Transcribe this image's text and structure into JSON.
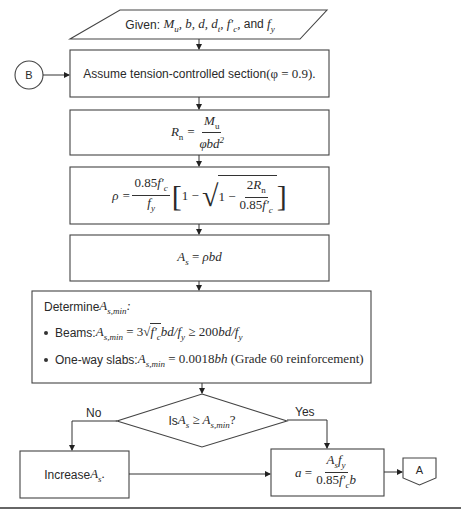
{
  "diagram": {
    "type": "flowchart",
    "nodes": {
      "given": {
        "shape": "parallelogram",
        "prefix": "Given: ",
        "vars": "Mu, b, d, dt, f'c, and fy"
      },
      "assume": {
        "shape": "process",
        "text": "Assume tension-controlled section ",
        "math": "(φ = 0.9)."
      },
      "rn": {
        "shape": "process",
        "lhs": "Rn =",
        "num": "Mu",
        "den": "φbd²"
      },
      "rho": {
        "shape": "process",
        "lhs": "ρ =",
        "num": "0.85f'c",
        "den": "fy",
        "bracket": "[1 − √(1 − 2Rn / 0.85f'c)]",
        "inner_num": "2Rn",
        "inner_den": "0.85f'c"
      },
      "as": {
        "shape": "process",
        "text": "As = ρbd"
      },
      "determine": {
        "shape": "process",
        "title": "Determine ",
        "title_math": "As,min:",
        "bullets": [
          {
            "label": "Beams: ",
            "math": "As,min = 3√f'c bd/fy ≥ 200bd/fy"
          },
          {
            "label": "One-way slabs: ",
            "math": "As,min = 0.0018bh (Grade 60 reinforcement)"
          }
        ]
      },
      "decision": {
        "shape": "diamond",
        "prefix": "Is ",
        "math": "As ≥ As,min?"
      },
      "increase": {
        "shape": "process",
        "text": "Increase ",
        "math": "As."
      },
      "a": {
        "shape": "process",
        "lhs": "a =",
        "num": "As fy",
        "den": "0.85f'c b"
      },
      "connector_b": {
        "shape": "on-page-connector",
        "label": "B"
      },
      "connector_a": {
        "shape": "off-page-connector",
        "label": "A"
      }
    },
    "edges": [
      {
        "from": "given",
        "to": "assume"
      },
      {
        "from": "connector_b",
        "to": "assume"
      },
      {
        "from": "assume",
        "to": "rn"
      },
      {
        "from": "rn",
        "to": "rho"
      },
      {
        "from": "rho",
        "to": "as"
      },
      {
        "from": "as",
        "to": "determine"
      },
      {
        "from": "determine",
        "to": "decision"
      },
      {
        "from": "decision",
        "to": "increase",
        "label": "No"
      },
      {
        "from": "decision",
        "to": "a",
        "label": "Yes"
      },
      {
        "from": "increase",
        "to": "a"
      },
      {
        "from": "a",
        "to": "connector_a"
      }
    ],
    "edge_labels": {
      "no": "No",
      "yes": "Yes"
    }
  }
}
